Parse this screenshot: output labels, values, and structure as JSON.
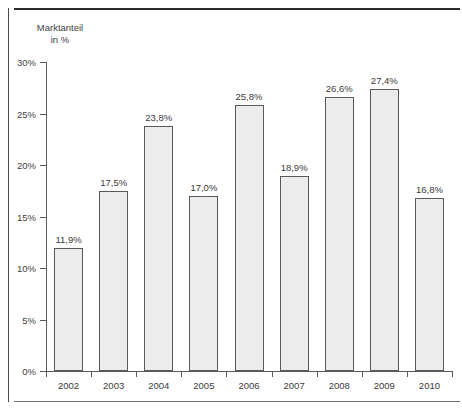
{
  "chart_data": {
    "type": "bar",
    "title": "",
    "ylabel_line1": "Marktanteil",
    "ylabel_line2": "in %",
    "xlabel": "",
    "categories": [
      "2002",
      "2003",
      "2004",
      "2005",
      "2006",
      "2007",
      "2008",
      "2009",
      "2010"
    ],
    "values": [
      11.9,
      17.5,
      23.8,
      17.0,
      25.8,
      18.9,
      26.6,
      27.4,
      16.8
    ],
    "data_labels": [
      "11,9%",
      "17,5%",
      "23,8%",
      "17,0%",
      "25,8%",
      "18,9%",
      "26,6%",
      "27,4%",
      "16,8%"
    ],
    "ylim": [
      0,
      30
    ],
    "ytick_values": [
      0,
      5,
      10,
      15,
      20,
      25,
      30
    ],
    "ytick_labels": [
      "0%",
      "5%",
      "10%",
      "15%",
      "20%",
      "25%",
      "30%"
    ],
    "grid": false,
    "legend": false,
    "bar_fill_color": "#ececec",
    "bar_border_color": "#595959",
    "axis_color": "#5a5a5a",
    "text_color": "#3a3a3a"
  }
}
